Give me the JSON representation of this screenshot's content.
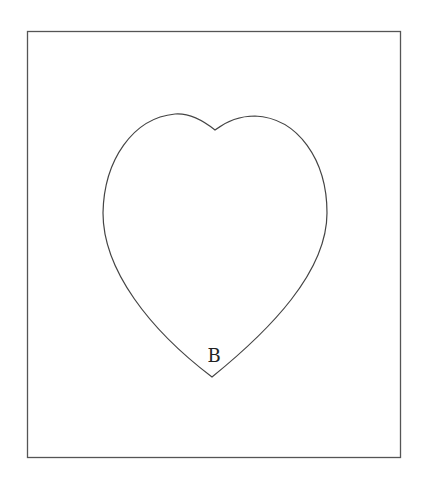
{
  "figure": {
    "type": "heart-shape-diagram",
    "frame": {
      "x": 27,
      "y": 31,
      "width": 373,
      "height": 426,
      "stroke": "#555555"
    },
    "shape": {
      "name": "heart",
      "stroke": "#444444"
    },
    "labels": [
      {
        "text": "B",
        "x": 214,
        "y": 362,
        "refers_to": "bottom point of heart"
      }
    ]
  }
}
